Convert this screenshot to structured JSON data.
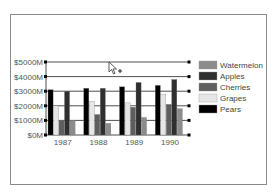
{
  "chart_data": {
    "type": "bar",
    "title": "",
    "xlabel": "",
    "ylabel": "",
    "categories": [
      "1987",
      "1988",
      "1989",
      "1990"
    ],
    "series": [
      {
        "name": "Pears",
        "color": "#000000",
        "values": [
          3100,
          3200,
          3300,
          3400
        ]
      },
      {
        "name": "Grapes",
        "color": "#e6e6e6",
        "values": [
          2000,
          2300,
          2200,
          2800
        ]
      },
      {
        "name": "Cherries",
        "color": "#5e5e5e",
        "values": [
          1000,
          1400,
          1900,
          2100
        ]
      },
      {
        "name": "Apples",
        "color": "#2f2f2f",
        "values": [
          3000,
          3200,
          3600,
          3800
        ]
      },
      {
        "name": "Watermelon",
        "color": "#8c8c8c",
        "values": [
          1000,
          800,
          1200,
          1800
        ]
      }
    ],
    "y_ticks": [
      "$0M",
      "$1000M",
      "$2000M",
      "$3000M",
      "$4000M",
      "$5000M"
    ],
    "ylim": [
      0,
      5000
    ],
    "grid": true,
    "legend_position": "right",
    "legend_order": [
      "Watermelon",
      "Apples",
      "Cherries",
      "Grapes",
      "Pears"
    ]
  },
  "cursor": {
    "type": "arrow-with-plus"
  }
}
